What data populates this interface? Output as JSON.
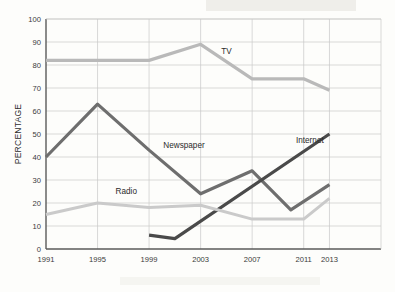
{
  "chart_data": {
    "type": "line",
    "title": "",
    "xlabel": "",
    "ylabel": "PERCENTAGE",
    "ylim": [
      0,
      100
    ],
    "ytick_step": 10,
    "yticks": [
      "0",
      "10",
      "20",
      "30",
      "40",
      "50",
      "60",
      "70",
      "80",
      "90",
      "100"
    ],
    "x": [
      1991,
      1995,
      1999,
      2003,
      2007,
      2011,
      2013
    ],
    "categories": [
      "1991",
      "1995",
      "1999",
      "2003",
      "2007",
      "2011",
      "2013"
    ],
    "grid": "both",
    "legend_position": "inline-labels",
    "series": [
      {
        "name": "TV",
        "color": "#b9b9b9",
        "stroke_width": 3.2,
        "label_x": 2004.6,
        "label_y": 85,
        "points": [
          {
            "x": 1991,
            "y": 82
          },
          {
            "x": 1995,
            "y": 82
          },
          {
            "x": 1999,
            "y": 82
          },
          {
            "x": 2003,
            "y": 89
          },
          {
            "x": 2007,
            "y": 74
          },
          {
            "x": 2011,
            "y": 74
          },
          {
            "x": 2013,
            "y": 69
          }
        ]
      },
      {
        "name": "Newspaper",
        "color": "#6e6e6e",
        "stroke_width": 3.2,
        "label_x": 2000.1,
        "label_y": 44,
        "points": [
          {
            "x": 1991,
            "y": 40
          },
          {
            "x": 1995,
            "y": 63
          },
          {
            "x": 1999,
            "y": 43
          },
          {
            "x": 2003,
            "y": 24
          },
          {
            "x": 2007,
            "y": 34
          },
          {
            "x": 2010,
            "y": 17
          },
          {
            "x": 2013,
            "y": 28
          }
        ]
      },
      {
        "name": "Internet",
        "color": "#4a4a4a",
        "stroke_width": 3.2,
        "label_x": 2010.4,
        "label_y": 46,
        "points": [
          {
            "x": 1999,
            "y": 6
          },
          {
            "x": 2001,
            "y": 4.5
          },
          {
            "x": 2013,
            "y": 50
          }
        ]
      },
      {
        "name": "Radio",
        "color": "#cacaca",
        "stroke_width": 3.0,
        "label_x": 1996.4,
        "label_y": 24,
        "points": [
          {
            "x": 1991,
            "y": 15
          },
          {
            "x": 1995,
            "y": 20
          },
          {
            "x": 1999,
            "y": 18
          },
          {
            "x": 2003,
            "y": 19
          },
          {
            "x": 2007,
            "y": 13
          },
          {
            "x": 2011,
            "y": 13
          },
          {
            "x": 2013,
            "y": 22
          }
        ]
      }
    ]
  },
  "colors": {
    "axis": "#5a5a5a",
    "grid": "#c9c9c9",
    "background": "#fdfdfb",
    "text": "#2e2e2e"
  }
}
